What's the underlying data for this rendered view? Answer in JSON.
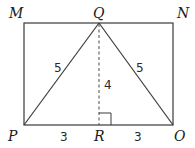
{
  "diagram": {
    "type": "geometry",
    "points": {
      "M": {
        "label": "M",
        "x": 24,
        "y": 23
      },
      "Q": {
        "label": "Q",
        "x": 99,
        "y": 23
      },
      "N": {
        "label": "N",
        "x": 173,
        "y": 23
      },
      "P": {
        "label": "P",
        "x": 24,
        "y": 125
      },
      "R": {
        "label": "R",
        "x": 99,
        "y": 125
      },
      "O": {
        "label": "O",
        "x": 173,
        "y": 125
      }
    },
    "segments": [
      {
        "from": "M",
        "to": "N",
        "style": "solid"
      },
      {
        "from": "N",
        "to": "O",
        "style": "solid"
      },
      {
        "from": "O",
        "to": "P",
        "style": "solid"
      },
      {
        "from": "P",
        "to": "M",
        "style": "solid"
      },
      {
        "from": "P",
        "to": "Q",
        "style": "solid",
        "length_label": "5"
      },
      {
        "from": "Q",
        "to": "O",
        "style": "solid",
        "length_label": "5"
      },
      {
        "from": "Q",
        "to": "R",
        "style": "dashed",
        "length_label": "4"
      },
      {
        "from": "P",
        "to": "R",
        "length_label": "3"
      },
      {
        "from": "R",
        "to": "O",
        "length_label": "3"
      }
    ],
    "right_angle_at": "R",
    "labels": {
      "M": "M",
      "Q": "Q",
      "N": "N",
      "P": "P",
      "R": "R",
      "O": "O",
      "PQ": "5",
      "QO": "5",
      "QR": "4",
      "PR": "3",
      "RO": "3"
    }
  }
}
